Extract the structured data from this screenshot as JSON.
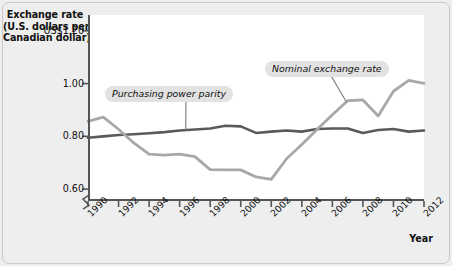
{
  "chart_data": {
    "type": "line",
    "title": "",
    "ylabel": "Exchange rate (U.S. dollars per Canadian dollar)",
    "ylabel_lines": [
      "Exchange rate",
      "(U.S. dollars per",
      "Canadian dollar)"
    ],
    "xlabel": "Year",
    "ylim": [
      0.555,
      1.26
    ],
    "xlim": [
      1990,
      2012
    ],
    "grid": false,
    "legend_position": "inline-annotations",
    "axis_break": true,
    "yticks": [
      1.2,
      1.0,
      0.8,
      0.6
    ],
    "ytick_labels": [
      "US$1.20",
      "1.00",
      "0.80",
      "0.60"
    ],
    "xticks": [
      1990,
      1992,
      1994,
      1996,
      1998,
      2000,
      2002,
      2004,
      2006,
      2008,
      2010,
      2012
    ],
    "xtick_labels": [
      "1990",
      "1992",
      "1994",
      "1996",
      "1998",
      "2000",
      "2002",
      "2004",
      "2006",
      "2008",
      "2010",
      "2012"
    ],
    "x": [
      1990,
      1991,
      1992,
      1993,
      1994,
      1995,
      1996,
      1997,
      1998,
      1999,
      2000,
      2001,
      2002,
      2003,
      2004,
      2005,
      2006,
      2007,
      2008,
      2009,
      2010,
      2011,
      2012
    ],
    "series": [
      {
        "name": "Purchasing power parity",
        "color": "#5a5a5a",
        "width": 2.6,
        "values": [
          0.795,
          0.8,
          0.805,
          0.808,
          0.812,
          0.816,
          0.822,
          0.826,
          0.83,
          0.84,
          0.838,
          0.813,
          0.818,
          0.822,
          0.818,
          0.828,
          0.83,
          0.83,
          0.813,
          0.824,
          0.828,
          0.818,
          0.822
        ]
      },
      {
        "name": "Nominal exchange rate",
        "color": "#a8a8a8",
        "width": 2.8,
        "values": [
          0.857,
          0.873,
          0.827,
          0.775,
          0.733,
          0.729,
          0.733,
          0.723,
          0.674,
          0.673,
          0.673,
          0.646,
          0.637,
          0.715,
          0.769,
          0.826,
          0.882,
          0.935,
          0.938,
          0.877,
          0.971,
          1.012,
          1.001
        ]
      }
    ],
    "annotations": [
      {
        "text": "Purchasing power parity",
        "target_year": 1996.4,
        "target_value": 0.824
      },
      {
        "text": "Nominal exchange rate",
        "target_year": 2006.9,
        "target_value": 0.932
      }
    ]
  }
}
